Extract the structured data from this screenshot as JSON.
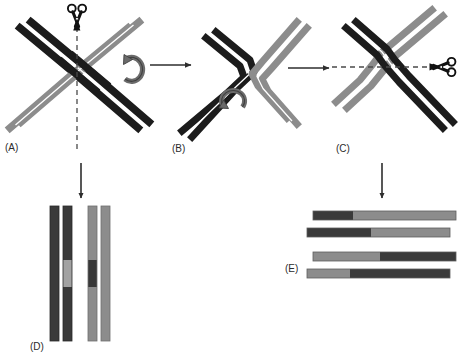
{
  "figure": {
    "background_color": "#ffffff"
  },
  "palette": {
    "dark_strand": "#3a3a3a",
    "dark_strand_edge": "#1c1c1c",
    "light_strand": "#8c8c8c",
    "light_strand_edge": "#6e6e6e",
    "mid_gray": "#6b6b6b",
    "arrow_color": "#2e2e2e",
    "dashed_line_color": "#4a4a4a",
    "scissors_color": "#111111",
    "label_color": "#2b2b2b"
  },
  "panels": [
    {
      "id": "A",
      "label": "(A)",
      "caption": "Crossed DNA duplexes forming a Holliday junction with a vertical cleavage axis",
      "cut_axis": "vertical",
      "has_scissors": true,
      "has_rotation_arrow": true
    },
    {
      "id": "B",
      "label": "(B)",
      "caption": "Isomerized (rotated) Holliday junction intermediate",
      "cut_axis": "none",
      "has_scissors": false,
      "has_rotation_arrow": true
    },
    {
      "id": "C",
      "label": "(C)",
      "caption": "Junction opened out with a horizontal cleavage axis",
      "cut_axis": "horizontal",
      "has_scissors": true,
      "has_rotation_arrow": false
    },
    {
      "id": "D",
      "label": "(D)",
      "caption": "Non-recombinant (patch) products: parental flanking arms with a short heteroduplex patch",
      "orientation": "vertical",
      "product_type": "patch"
    },
    {
      "id": "E",
      "label": "(E)",
      "caption": "Recombinant (splice) products: flanking arms exchanged at the crossover point",
      "orientation": "horizontal",
      "product_type": "splice"
    }
  ],
  "icons": {
    "scissors_vertical": "scissors-icon",
    "scissors_horizontal": "scissors-icon",
    "rotation_arrow": "rotate-arrow-icon",
    "arrow_right": "arrow-right-icon",
    "arrow_down": "arrow-down-icon"
  },
  "arrows": [
    {
      "name": "arrow-a-to-b",
      "direction": "right",
      "from": "A",
      "to": "B"
    },
    {
      "name": "arrow-b-to-c",
      "direction": "right",
      "from": "B",
      "to": "C"
    },
    {
      "name": "arrow-a-to-d",
      "direction": "down",
      "from": "A",
      "to": "D"
    },
    {
      "name": "arrow-c-to-e",
      "direction": "down",
      "from": "C",
      "to": "E"
    }
  ],
  "panel_d_products": [
    {
      "name": "strand-1",
      "segments": [
        {
          "color": "dark",
          "fraction": 1.0
        }
      ]
    },
    {
      "name": "strand-2",
      "segments": [
        {
          "color": "dark",
          "fraction": 0.4
        },
        {
          "color": "light",
          "fraction": 0.2
        },
        {
          "color": "dark",
          "fraction": 0.4
        }
      ]
    },
    {
      "name": "strand-3",
      "segments": [
        {
          "color": "light",
          "fraction": 0.4
        },
        {
          "color": "dark",
          "fraction": 0.2
        },
        {
          "color": "light",
          "fraction": 0.4
        }
      ]
    },
    {
      "name": "strand-4",
      "segments": [
        {
          "color": "light",
          "fraction": 1.0
        }
      ]
    }
  ],
  "panel_e_products": [
    {
      "name": "duplex-1-top",
      "segments": [
        {
          "color": "dark",
          "fraction": 0.28
        },
        {
          "color": "light",
          "fraction": 0.72
        }
      ]
    },
    {
      "name": "duplex-1-bottom",
      "segments": [
        {
          "color": "dark",
          "fraction": 0.45
        },
        {
          "color": "light",
          "fraction": 0.55
        }
      ]
    },
    {
      "name": "duplex-2-top",
      "segments": [
        {
          "color": "light",
          "fraction": 0.47
        },
        {
          "color": "dark",
          "fraction": 0.53
        }
      ]
    },
    {
      "name": "duplex-2-bottom",
      "segments": [
        {
          "color": "light",
          "fraction": 0.3
        },
        {
          "color": "dark",
          "fraction": 0.7
        }
      ]
    }
  ]
}
